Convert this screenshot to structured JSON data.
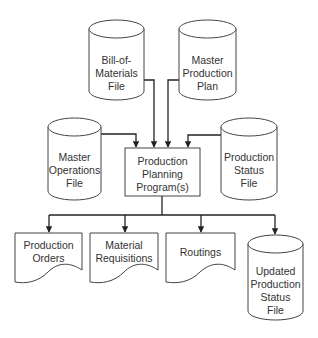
{
  "diagram": {
    "type": "system-flowchart",
    "inputs": [
      {
        "id": "bom",
        "shape": "disk-storage",
        "lines": [
          "Bill-of-",
          "Materials",
          "File"
        ]
      },
      {
        "id": "mpp",
        "shape": "disk-storage",
        "lines": [
          "Master",
          "Production",
          "Plan"
        ]
      },
      {
        "id": "mof",
        "shape": "disk-storage",
        "lines": [
          "Master",
          "Operations",
          "File"
        ]
      },
      {
        "id": "psf",
        "shape": "disk-storage",
        "lines": [
          "Production",
          "Status",
          "File"
        ]
      }
    ],
    "process": {
      "id": "ppp",
      "shape": "process",
      "lines": [
        "Production",
        "Planning",
        "Program(s)"
      ]
    },
    "outputs": [
      {
        "id": "po",
        "shape": "document",
        "lines": [
          "Production",
          "Orders"
        ]
      },
      {
        "id": "mr",
        "shape": "document",
        "lines": [
          "Material",
          "Requisitions"
        ]
      },
      {
        "id": "rt",
        "shape": "document",
        "lines": [
          "Routings"
        ]
      },
      {
        "id": "upsf",
        "shape": "disk-storage",
        "lines": [
          "Updated",
          "Production",
          "Status",
          "File"
        ]
      }
    ],
    "edges": [
      {
        "from": "bom",
        "to": "ppp"
      },
      {
        "from": "mpp",
        "to": "ppp"
      },
      {
        "from": "mof",
        "to": "ppp"
      },
      {
        "from": "psf",
        "to": "ppp"
      },
      {
        "from": "ppp",
        "to": "po"
      },
      {
        "from": "ppp",
        "to": "mr"
      },
      {
        "from": "ppp",
        "to": "rt"
      },
      {
        "from": "ppp",
        "to": "upsf"
      }
    ]
  }
}
